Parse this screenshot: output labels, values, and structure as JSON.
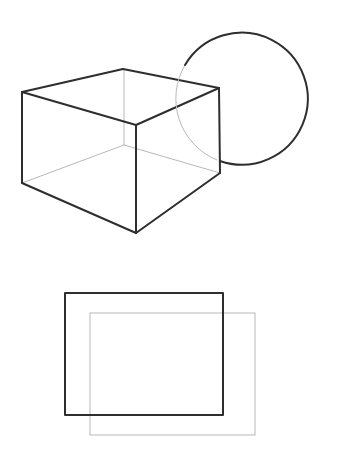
{
  "diagram": {
    "title": "",
    "colors": {
      "background": "#ffffff",
      "strong_line": "#2e2e2e",
      "faint_line": "#b8b8b8"
    },
    "cube": {
      "visible_edges": [
        [
          22,
          92,
          123,
          69
        ],
        [
          123,
          69,
          219,
          88
        ],
        [
          22,
          92,
          136,
          125
        ],
        [
          136,
          125,
          219,
          88
        ],
        [
          22,
          92,
          22,
          183
        ],
        [
          136,
          125,
          136,
          233
        ],
        [
          219,
          88,
          220,
          173
        ],
        [
          22,
          183,
          136,
          233
        ],
        [
          136,
          233,
          220,
          173
        ]
      ],
      "hidden_edges": [
        [
          124,
          69,
          124,
          145
        ],
        [
          124,
          145,
          22,
          183
        ],
        [
          124,
          145,
          220,
          173
        ]
      ]
    },
    "circle": {
      "cx": 242,
      "cy": 99,
      "r": 66,
      "hidden_arc": "M 217 160 A 66 66 0 0 1 185 65",
      "visible_arc": "M 185 65 A 66 66 0 1 1 220 161"
    },
    "rect_front": {
      "x": 65,
      "y": 293,
      "width": 158,
      "height": 122
    },
    "rect_back": {
      "x": 90,
      "y": 313,
      "width": 165,
      "height": 122
    }
  }
}
